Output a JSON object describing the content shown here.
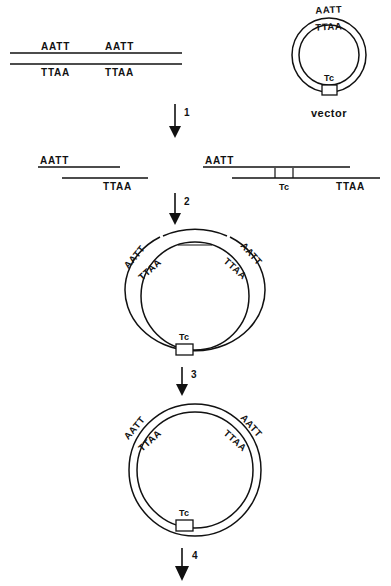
{
  "diagram": {
    "sequences": {
      "top_strand": "AATT",
      "bottom_strand": "TTAA"
    },
    "marker": "Tc",
    "vector_label": "vector",
    "steps": [
      {
        "number": "1"
      },
      {
        "number": "2"
      },
      {
        "number": "3"
      },
      {
        "number": "4"
      }
    ],
    "rows": {
      "row1": {
        "name": "linear-dna-with-two-sites",
        "sites": [
          {
            "top": "AATT",
            "bottom": "TTAA"
          },
          {
            "top": "AATT",
            "bottom": "TTAA"
          }
        ],
        "vector": {
          "top": "AATT",
          "bottom": "TTAA",
          "marker": "Tc",
          "label": "vector"
        }
      },
      "row2": {
        "name": "cut-fragments",
        "insert": {
          "top": "AATT",
          "bottom": "TTAA"
        },
        "linear_vector": {
          "top": "AATT",
          "bottom": "TTAA",
          "marker": "Tc"
        }
      },
      "row3": {
        "name": "annealed-nicked-circle",
        "left_top": "AATT",
        "left_bottom": "TTAA",
        "right_top": "AATT",
        "right_bottom": "TTAA",
        "marker": "Tc"
      },
      "row4": {
        "name": "ligated-closed-circle",
        "left_top": "AATT",
        "left_bottom": "TTAA",
        "right_top": "AATT",
        "right_bottom": "TTAA",
        "marker": "Tc"
      }
    }
  },
  "colors": {
    "ink": "#111111",
    "background": "#ffffff"
  }
}
